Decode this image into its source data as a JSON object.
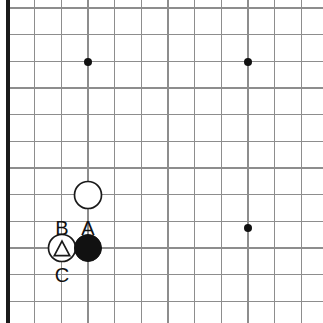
{
  "board": {
    "type": "go-board-diagram",
    "description": "Go board corner diagram, top-left quadrant shown",
    "background_color": "#ffffff",
    "grid": {
      "line_color": "#8d8d8d",
      "edge_color": "#1a1a1a",
      "spacing_px": 26.67,
      "origin_x": 8,
      "origin_y": 8,
      "columns": 12,
      "rows": 12,
      "edges": [
        "left",
        "bottom"
      ]
    },
    "star_points": [
      {
        "name": "star-point-upper-left",
        "x": 88,
        "y": 62
      },
      {
        "name": "star-point-upper-right",
        "x": 248,
        "y": 62
      },
      {
        "name": "star-point-center-right",
        "x": 248,
        "y": 228
      }
    ],
    "star_point_radius": 4,
    "stone_radius": 13.5,
    "stones": [
      {
        "name": "white-stone-upper",
        "color": "white",
        "color_hex": "#ffffff",
        "x": 88,
        "y": 195,
        "marker": "none"
      },
      {
        "name": "white-stone-triangle",
        "color": "white",
        "color_hex": "#ffffff",
        "x": 62,
        "y": 248,
        "marker": "triangle"
      },
      {
        "name": "black-stone",
        "color": "black",
        "color_hex": "#111111",
        "x": 88,
        "y": 248,
        "marker": "none"
      }
    ],
    "labels": [
      {
        "name": "point-label-b",
        "text": "B",
        "x": 62,
        "y": 228
      },
      {
        "name": "point-label-a",
        "text": "A",
        "x": 88,
        "y": 228
      },
      {
        "name": "point-label-c",
        "text": "C",
        "x": 62,
        "y": 275
      }
    ]
  }
}
